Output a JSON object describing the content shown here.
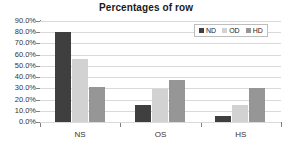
{
  "chart_data": {
    "type": "bar",
    "title": "Percentages of row",
    "xlabel": "",
    "ylabel": "",
    "categories": [
      "NS",
      "OS",
      "HS"
    ],
    "series": [
      {
        "name": "ND",
        "color": "#3f3f3f",
        "values": [
          80.0,
          15.5,
          5.5
        ]
      },
      {
        "name": "OD",
        "color": "#d2d2d2",
        "values": [
          56.0,
          29.0,
          15.0
        ]
      },
      {
        "name": "HD",
        "color": "#969696",
        "values": [
          31.0,
          37.5,
          30.5
        ]
      }
    ],
    "ylim": [
      0,
      90
    ],
    "ytick_values": [
      0,
      10,
      20,
      30,
      40,
      50,
      60,
      70,
      80,
      90
    ],
    "ytick_labels": [
      "0.0%",
      "10.0%",
      "20.0%",
      "30.0%",
      "40.0%",
      "50.0%",
      "60.0%",
      "70.0%",
      "80.0%",
      "90.0%"
    ],
    "grid": true,
    "grid_axis": "y",
    "legend_position": "top-right",
    "legend_entries": [
      "ND",
      "OD",
      "HD"
    ],
    "gridline_color": "#d9d9d9",
    "axis_color": "#808080",
    "background_color": "#ffffff",
    "title_color": "#1a1a1a"
  }
}
